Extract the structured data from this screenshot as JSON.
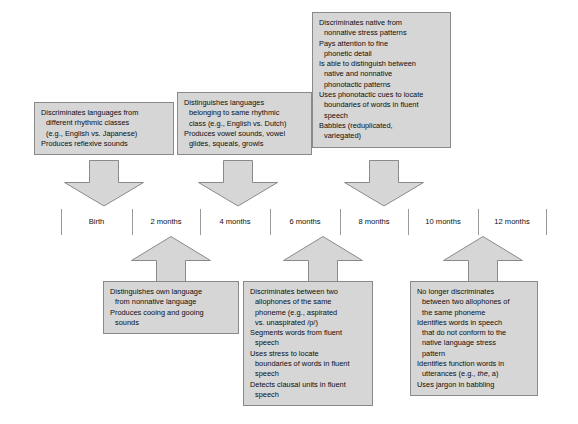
{
  "figure": {
    "type": "developmental-timeline",
    "title": "",
    "background_color": "#ffffff",
    "box_fill": "#d6d6d6",
    "box_border": "#8a8a8a",
    "arrow_fill": "#d6d6d6"
  },
  "timeline": {
    "labels": [
      "Birth",
      "2 months",
      "4 months",
      "6 months",
      "8 months",
      "10 months",
      "12 months"
    ],
    "tick_count": 8
  },
  "top_boxes": [
    {
      "id": "box-birth",
      "anchor_label": "Birth",
      "lines": [
        {
          "text": "Discriminates languages from",
          "indent": false
        },
        {
          "text": "different rhythmic classes",
          "indent": true
        },
        {
          "text": "(e.g., English vs. Japanese)",
          "indent": true
        },
        {
          "text": "Produces reflexive sounds",
          "indent": false
        }
      ]
    },
    {
      "id": "box-4-months",
      "anchor_label": "4 months",
      "lines": [
        {
          "text": "Distinguishes languages",
          "indent": false
        },
        {
          "text": "belonging to same rhythmic",
          "indent": true
        },
        {
          "text": "class (e.g., English vs. Dutch)",
          "indent": true
        },
        {
          "text": "Produces vowel sounds, vowel",
          "indent": false
        },
        {
          "text": "glides, squeals, growls",
          "indent": true
        }
      ]
    },
    {
      "id": "box-8-months",
      "anchor_label": "8 months",
      "lines": [
        {
          "text": "Discriminates native from",
          "indent": false
        },
        {
          "text": "nonnative stress patterns",
          "indent": true
        },
        {
          "text": "Pays attention to fine",
          "indent": false
        },
        {
          "text": "phonetic detail",
          "indent": true
        },
        {
          "text": "Is able to distinguish between",
          "indent": false
        },
        {
          "text": "native and nonnative",
          "indent": true
        },
        {
          "text": "phonotactic patterns",
          "indent": true
        },
        {
          "text": "Uses phonotactic cues to locate",
          "indent": false
        },
        {
          "text": "boundaries of words in fluent",
          "indent": true
        },
        {
          "text": "speech",
          "indent": true
        },
        {
          "text": "Babbles (reduplicated,",
          "indent": false
        },
        {
          "text": "variegated)",
          "indent": true
        }
      ]
    }
  ],
  "bottom_boxes": [
    {
      "id": "box-2-months",
      "anchor_label": "2 months",
      "lines": [
        {
          "text": "Distinguishes own language",
          "indent": false
        },
        {
          "text": "from nonnative language",
          "indent": true
        },
        {
          "text": "Produces cooing and gooing",
          "indent": false
        },
        {
          "text": "sounds",
          "indent": true
        }
      ]
    },
    {
      "id": "box-6-months",
      "anchor_label": "6 months",
      "lines": [
        {
          "text": "Discriminates between two",
          "indent": false
        },
        {
          "text": "allophones of the same",
          "indent": true
        },
        {
          "text": "phoneme (e.g., aspirated",
          "indent": true
        },
        {
          "text": "vs. unaspirated /p/)",
          "indent": true
        },
        {
          "text": "Segments words from fluent",
          "indent": false
        },
        {
          "text": "speech",
          "indent": true
        },
        {
          "text": "Uses stress to locate",
          "indent": false
        },
        {
          "text": "boundaries of words in fluent",
          "indent": true
        },
        {
          "text": "speech",
          "indent": true
        },
        {
          "text": "Detects clausal units in fluent",
          "indent": false
        },
        {
          "text": "speech",
          "indent": true
        }
      ]
    },
    {
      "id": "box-10-months",
      "anchor_label": "10 months",
      "lines": [
        {
          "text": "No longer discriminates",
          "indent": false
        },
        {
          "text": "between two allophones of",
          "indent": true
        },
        {
          "text": "the same phoneme",
          "indent": true
        },
        {
          "text": "Identifies words in speech",
          "indent": false
        },
        {
          "text": "that do not conform to the",
          "indent": true
        },
        {
          "text": "native language stress",
          "indent": true
        },
        {
          "text": "pattern",
          "indent": true
        },
        {
          "text": "Identifies function words in",
          "indent": false
        },
        {
          "text": "utterances (e.g., ",
          "italic": "the",
          "text_after": ", a)",
          "indent": true
        },
        {
          "text": "Uses jargon in babbling",
          "indent": false
        }
      ]
    }
  ],
  "arrows": [
    {
      "id": "arrow-birth-down",
      "direction": "down",
      "from": "box-birth",
      "to": "Birth"
    },
    {
      "id": "arrow-4-months-down",
      "direction": "down",
      "from": "box-4-months",
      "to": "4 months"
    },
    {
      "id": "arrow-8-months-down",
      "direction": "down",
      "from": "box-8-months",
      "to": "8 months"
    },
    {
      "id": "arrow-2-months-up",
      "direction": "up",
      "from": "box-2-months",
      "to": "2 months"
    },
    {
      "id": "arrow-6-months-up",
      "direction": "up",
      "from": "box-6-months",
      "to": "6 months"
    },
    {
      "id": "arrow-10-months-up",
      "direction": "up",
      "from": "box-10-months",
      "to": "10 months"
    }
  ]
}
